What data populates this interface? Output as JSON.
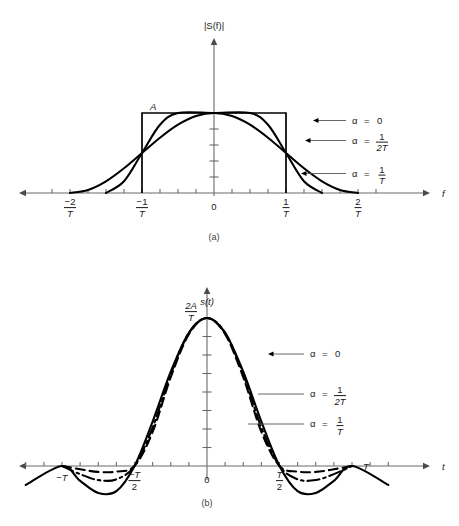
{
  "figure": {
    "background_color": "#ffffff",
    "ink_color": "#000000",
    "axis_color": "#6b6b6b"
  },
  "panels": [
    {
      "id": "a",
      "caption": "(a)",
      "y_axis_label": "|S(f)|",
      "x_axis_label": "f",
      "amplitude_label": "A",
      "origin_label": "0",
      "x_tick_labels": [
        {
          "num": "−2",
          "den": "T"
        },
        {
          "num": "−1",
          "den": "T"
        },
        {
          "num": "1",
          "den": "T"
        },
        {
          "num": "2",
          "den": "T"
        }
      ],
      "annotations": [
        {
          "alpha": "α",
          "eq": "=",
          "value": "0",
          "num": null,
          "den": null
        },
        {
          "alpha": "α",
          "eq": "=",
          "value": null,
          "num": "1",
          "den": "2T"
        },
        {
          "alpha": "α",
          "eq": "=",
          "value": null,
          "num": "1",
          "den": "T"
        }
      ]
    },
    {
      "id": "b",
      "caption": "(b)",
      "y_axis_label": "s(t)",
      "x_axis_label": "t",
      "peak_label": {
        "num": "2A",
        "den": "T"
      },
      "origin_label": "0",
      "x_tick_labels": [
        {
          "num": null,
          "den": null,
          "text": "−T"
        },
        {
          "num": "−T",
          "den": "2"
        },
        {
          "num": "T",
          "den": "2"
        },
        {
          "num": null,
          "den": null,
          "text": "T"
        }
      ],
      "annotations": [
        {
          "alpha": "α",
          "eq": "=",
          "value": "0",
          "num": null,
          "den": null
        },
        {
          "alpha": "α",
          "eq": "=",
          "value": null,
          "num": "1",
          "den": "2T"
        },
        {
          "alpha": "α",
          "eq": "=",
          "value": null,
          "num": "1",
          "den": "T"
        }
      ]
    }
  ],
  "chart_data": {
    "type": "line",
    "charts": [
      {
        "panel": "a",
        "type": "line",
        "title": "",
        "xlabel": "f",
        "ylabel": "|S(f)|",
        "xlim": [
          -2.35,
          2.35
        ],
        "ylim": [
          0,
          1.18
        ],
        "x_unit": "1/T",
        "y_unit": "A",
        "grid": false,
        "x_ticks": [
          -2,
          -1,
          0,
          1,
          2
        ],
        "x_tick_labels": [
          "-2/T",
          "-1/T",
          "0",
          "1/T",
          "2/T"
        ],
        "x_minor_tick_step": 0.25,
        "y_tick_count": 4,
        "legend_position": "right",
        "series": [
          {
            "name": "alpha = 0",
            "style": "solid",
            "description": "ideal brick-wall rectangle of height A from -1/T to 1/T",
            "formula": "A for |f| <= 1/T, else 0",
            "alpha": 0,
            "points": [
              {
                "f": -1.0,
                "y": 0
              },
              {
                "f": -1.0,
                "y": 1.0
              },
              {
                "f": 1.0,
                "y": 1.0
              },
              {
                "f": 1.0,
                "y": 0
              }
            ]
          },
          {
            "name": "alpha = 1/(2T)",
            "style": "solid",
            "description": "raised cosine with 50 percent rolloff, zero at 1.5/T",
            "alpha": 0.5,
            "points": [
              {
                "f": -1.5,
                "y": 0.0
              },
              {
                "f": -1.25,
                "y": 0.146
              },
              {
                "f": -1.0,
                "y": 0.5
              },
              {
                "f": -0.75,
                "y": 0.854
              },
              {
                "f": -0.5,
                "y": 1.0
              },
              {
                "f": 0.0,
                "y": 1.0
              },
              {
                "f": 0.5,
                "y": 1.0
              },
              {
                "f": 0.75,
                "y": 0.854
              },
              {
                "f": 1.0,
                "y": 0.5
              },
              {
                "f": 1.25,
                "y": 0.146
              },
              {
                "f": 1.5,
                "y": 0.0
              }
            ]
          },
          {
            "name": "alpha = 1/T",
            "style": "solid",
            "description": "raised cosine with full rolloff, zero at 2/T",
            "alpha": 1.0,
            "points": [
              {
                "f": -2.0,
                "y": 0.0
              },
              {
                "f": -1.75,
                "y": 0.038
              },
              {
                "f": -1.5,
                "y": 0.146
              },
              {
                "f": -1.25,
                "y": 0.309
              },
              {
                "f": -1.0,
                "y": 0.5
              },
              {
                "f": -0.75,
                "y": 0.691
              },
              {
                "f": -0.5,
                "y": 0.854
              },
              {
                "f": -0.25,
                "y": 0.962
              },
              {
                "f": 0.0,
                "y": 1.0
              },
              {
                "f": 0.25,
                "y": 0.962
              },
              {
                "f": 0.5,
                "y": 0.854
              },
              {
                "f": 0.75,
                "y": 0.691
              },
              {
                "f": 1.0,
                "y": 0.5
              },
              {
                "f": 1.25,
                "y": 0.309
              },
              {
                "f": 1.5,
                "y": 0.146
              },
              {
                "f": 1.75,
                "y": 0.038
              },
              {
                "f": 2.0,
                "y": 0.0
              }
            ]
          }
        ]
      },
      {
        "panel": "b",
        "type": "line",
        "title": "",
        "xlabel": "t",
        "ylabel": "s(t)",
        "xlim": [
          -1.35,
          1.35
        ],
        "ylim": [
          -0.28,
          1.1
        ],
        "x_unit": "T",
        "y_unit": "2A/T",
        "grid": false,
        "x_ticks": [
          -1,
          -0.5,
          0,
          0.5,
          1
        ],
        "x_tick_labels": [
          "-T",
          "-T/2",
          "0",
          "T/2",
          "T"
        ],
        "x_minor_tick_step": 0.125,
        "y_tick_count": 7,
        "peak_value": "2A/T",
        "legend_position": "right",
        "series": [
          {
            "name": "alpha = 0",
            "style": "solid",
            "description": "sinc pulse, deepest negative sidelobes",
            "alpha": 0,
            "points": [
              {
                "t": -1.25,
                "y": -0.128
              },
              {
                "t": -1.0,
                "y": 0.0
              },
              {
                "t": -0.875,
                "y": -0.1
              },
              {
                "t": -0.75,
                "y": -0.182
              },
              {
                "t": -0.625,
                "y": -0.17
              },
              {
                "t": -0.5,
                "y": 0.0
              },
              {
                "t": -0.375,
                "y": 0.3
              },
              {
                "t": -0.25,
                "y": 0.637
              },
              {
                "t": -0.125,
                "y": 0.9
              },
              {
                "t": 0.0,
                "y": 1.0
              },
              {
                "t": 0.125,
                "y": 0.9
              },
              {
                "t": 0.25,
                "y": 0.637
              },
              {
                "t": 0.375,
                "y": 0.3
              },
              {
                "t": 0.5,
                "y": 0.0
              },
              {
                "t": 0.625,
                "y": -0.17
              },
              {
                "t": 0.75,
                "y": -0.182
              },
              {
                "t": 0.875,
                "y": -0.1
              },
              {
                "t": 1.0,
                "y": 0.0
              },
              {
                "t": 1.25,
                "y": -0.128
              }
            ]
          },
          {
            "name": "alpha = 1/(2T)",
            "style": "dash-dot",
            "description": "intermediate rolloff, shallower sidelobes",
            "alpha": 0.5,
            "points": [
              {
                "t": -1.0,
                "y": 0.0
              },
              {
                "t": -0.875,
                "y": -0.055
              },
              {
                "t": -0.75,
                "y": -0.095
              },
              {
                "t": -0.625,
                "y": -0.09
              },
              {
                "t": -0.5,
                "y": 0.0
              },
              {
                "t": -0.375,
                "y": 0.26
              },
              {
                "t": -0.25,
                "y": 0.62
              },
              {
                "t": -0.125,
                "y": 0.9
              },
              {
                "t": 0.0,
                "y": 1.0
              },
              {
                "t": 0.125,
                "y": 0.9
              },
              {
                "t": 0.25,
                "y": 0.62
              },
              {
                "t": 0.375,
                "y": 0.26
              },
              {
                "t": 0.5,
                "y": 0.0
              },
              {
                "t": 0.625,
                "y": -0.09
              },
              {
                "t": 0.75,
                "y": -0.095
              },
              {
                "t": 0.875,
                "y": -0.055
              },
              {
                "t": 1.0,
                "y": 0.0
              }
            ]
          },
          {
            "name": "alpha = 1/T",
            "style": "dashed",
            "description": "full rolloff, shallowest sidelobes",
            "alpha": 1.0,
            "points": [
              {
                "t": -1.0,
                "y": 0.0
              },
              {
                "t": -0.875,
                "y": -0.022
              },
              {
                "t": -0.75,
                "y": -0.04
              },
              {
                "t": -0.625,
                "y": -0.038
              },
              {
                "t": -0.5,
                "y": 0.0
              },
              {
                "t": -0.375,
                "y": 0.23
              },
              {
                "t": -0.25,
                "y": 0.6
              },
              {
                "t": -0.125,
                "y": 0.89
              },
              {
                "t": 0.0,
                "y": 1.0
              },
              {
                "t": 0.125,
                "y": 0.89
              },
              {
                "t": 0.25,
                "y": 0.6
              },
              {
                "t": 0.375,
                "y": 0.23
              },
              {
                "t": 0.5,
                "y": 0.0
              },
              {
                "t": 0.625,
                "y": -0.038
              },
              {
                "t": 0.75,
                "y": -0.04
              },
              {
                "t": 0.875,
                "y": -0.022
              },
              {
                "t": 1.0,
                "y": 0.0
              }
            ]
          }
        ]
      }
    ]
  }
}
